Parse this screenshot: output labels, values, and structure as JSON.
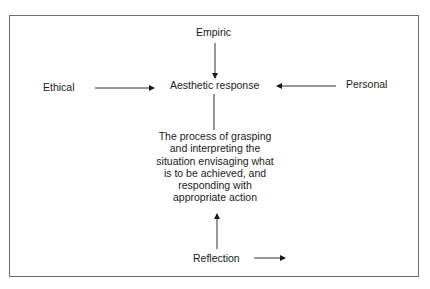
{
  "diagram": {
    "nodes": {
      "empiric": "Empiric",
      "ethical": "Ethical",
      "aesthetic_response": "Aesthetic response",
      "personal": "Personal",
      "reflection": "Reflection",
      "process_lines": [
        "The process of grasping",
        "and interpreting the",
        "situation envisaging what",
        "is to be achieved, and",
        "responding with",
        "appropriate action"
      ]
    },
    "edges": [
      {
        "from": "Empiric",
        "to": "Aesthetic response",
        "direction": "down"
      },
      {
        "from": "Ethical",
        "to": "Aesthetic response",
        "direction": "right"
      },
      {
        "from": "Personal",
        "to": "Aesthetic response",
        "direction": "left"
      },
      {
        "from": "Aesthetic response",
        "to": "The process of grasping",
        "type": "line"
      },
      {
        "from": "Reflection",
        "to": "The process of grasping",
        "direction": "up"
      },
      {
        "from": "Reflection",
        "to": "",
        "direction": "right"
      }
    ],
    "colors": {
      "line": "#1a1a1a",
      "frame": "#6e6e6e",
      "background": "#ffffff"
    }
  }
}
